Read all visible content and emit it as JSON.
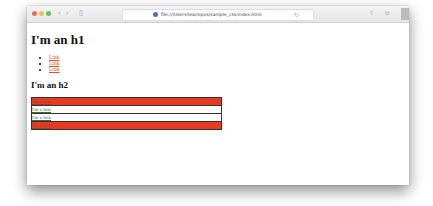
{
  "browser": {
    "url": "file:///Users/lea/repos/sample_css/index.html",
    "traffic_lights": [
      "#ee6a5f",
      "#f5be4f",
      "#62c454"
    ],
    "nav_back": "‹",
    "nav_forward": "›",
    "sidebar_icon": "▯",
    "reload_icon": "↻",
    "share_icon": "⇧",
    "tabs_icon": "⧉",
    "new_tab_icon": "+"
  },
  "page": {
    "h1": "I'm an h1",
    "links": [
      "Link",
      "Link",
      "Link"
    ],
    "h2": "I'm an h2",
    "table_rows": [
      {
        "text": "I'm a link",
        "style": "red"
      },
      {
        "text": "I'm a link",
        "style": "white"
      },
      {
        "text": "I'm a link",
        "style": "white"
      },
      {
        "text": "I'm a link",
        "style": "red"
      }
    ]
  }
}
